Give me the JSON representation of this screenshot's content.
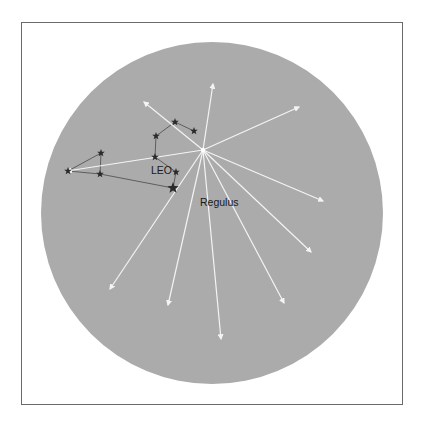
{
  "diagram": {
    "colors": {
      "background": "#ffffff",
      "frame": "#6a6a6a",
      "sky": "#ababab",
      "meteor_trail": "#f4f4f4",
      "constellation_line": "#555555",
      "star": "#2a2a2a",
      "label": "#1a1a1a"
    },
    "sky_disc": {
      "cx": 212,
      "cy": 213,
      "r": 171
    },
    "radiant": {
      "name": "Regulus",
      "x": 203,
      "y": 150
    },
    "labels": {
      "constellation": "LEO",
      "radiant_star": "Regulus"
    },
    "meteor_trails": [
      {
        "x1": 203,
        "y1": 150,
        "x2": 144,
        "y2": 102
      },
      {
        "x1": 203,
        "y1": 150,
        "x2": 213,
        "y2": 84
      },
      {
        "x1": 203,
        "y1": 150,
        "x2": 299,
        "y2": 107
      },
      {
        "x1": 203,
        "y1": 150,
        "x2": 323,
        "y2": 201
      },
      {
        "x1": 203,
        "y1": 150,
        "x2": 311,
        "y2": 252
      },
      {
        "x1": 203,
        "y1": 150,
        "x2": 284,
        "y2": 303
      },
      {
        "x1": 203,
        "y1": 150,
        "x2": 221,
        "y2": 339
      },
      {
        "x1": 203,
        "y1": 150,
        "x2": 168,
        "y2": 305
      },
      {
        "x1": 203,
        "y1": 150,
        "x2": 110,
        "y2": 289
      },
      {
        "x1": 203,
        "y1": 150,
        "x2": 67,
        "y2": 171
      }
    ],
    "stars": [
      {
        "x": 175,
        "y": 122,
        "size": 4
      },
      {
        "x": 194,
        "y": 131,
        "size": 4
      },
      {
        "x": 156,
        "y": 136,
        "size": 4
      },
      {
        "x": 155,
        "y": 157,
        "size": 4
      },
      {
        "x": 176,
        "y": 172,
        "size": 4
      },
      {
        "x": 173,
        "y": 188,
        "size": 6
      },
      {
        "x": 101,
        "y": 153,
        "size": 4
      },
      {
        "x": 100,
        "y": 174,
        "size": 4
      },
      {
        "x": 68,
        "y": 171,
        "size": 4
      }
    ],
    "constellation_lines": [
      [
        175,
        122,
        194,
        131
      ],
      [
        175,
        122,
        156,
        136
      ],
      [
        156,
        136,
        155,
        157
      ],
      [
        155,
        157,
        176,
        172
      ],
      [
        176,
        172,
        173,
        188
      ],
      [
        173,
        188,
        100,
        174
      ],
      [
        100,
        174,
        101,
        153
      ],
      [
        101,
        153,
        68,
        171
      ],
      [
        68,
        171,
        100,
        174
      ]
    ]
  }
}
